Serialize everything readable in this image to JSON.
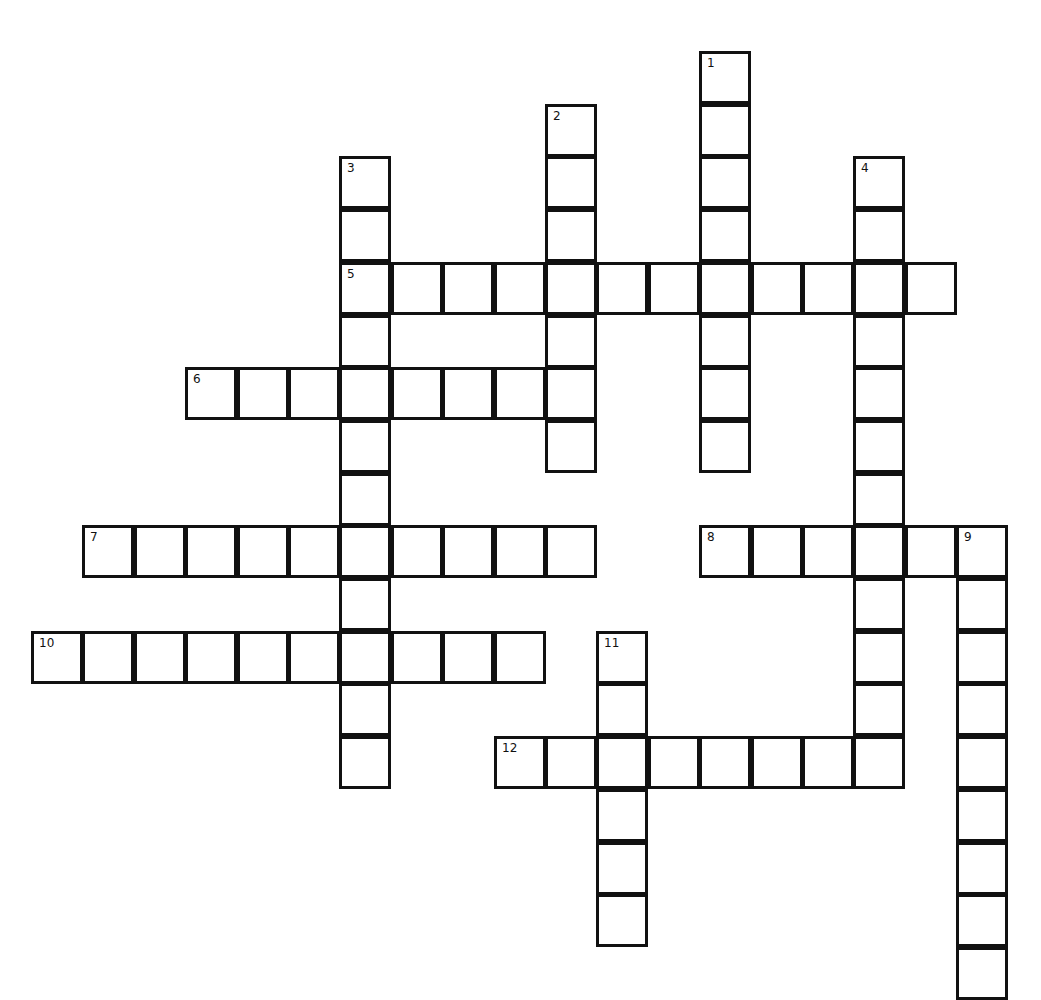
{
  "puzzle": {
    "type": "crossword",
    "grid": {
      "origin_x": 31,
      "origin_y": 51,
      "cell_pitch_x": 51.4,
      "cell_pitch_y": 52.7,
      "cols": 20,
      "rows": 18
    },
    "colors": {
      "border": "#111111",
      "cell_fill": "#ffffff",
      "background": "#ffffff"
    },
    "words": [
      {
        "number": "1",
        "direction": "down",
        "row": 0,
        "col": 13,
        "length": 8
      },
      {
        "number": "2",
        "direction": "down",
        "row": 1,
        "col": 10,
        "length": 7
      },
      {
        "number": "3",
        "direction": "down",
        "row": 2,
        "col": 6,
        "length": 12
      },
      {
        "number": "4",
        "direction": "down",
        "row": 2,
        "col": 16,
        "length": 12
      },
      {
        "number": "5",
        "direction": "across",
        "row": 4,
        "col": 6,
        "length": 12
      },
      {
        "number": "6",
        "direction": "across",
        "row": 6,
        "col": 3,
        "length": 8
      },
      {
        "number": "7",
        "direction": "across",
        "row": 9,
        "col": 1,
        "length": 10
      },
      {
        "number": "8",
        "direction": "across",
        "row": 9,
        "col": 13,
        "length": 6
      },
      {
        "number": "9",
        "direction": "down",
        "row": 9,
        "col": 18,
        "length": 9
      },
      {
        "number": "10",
        "direction": "across",
        "row": 11,
        "col": 0,
        "length": 10
      },
      {
        "number": "11",
        "direction": "down",
        "row": 11,
        "col": 11,
        "length": 6
      },
      {
        "number": "12",
        "direction": "across",
        "row": 13,
        "col": 9,
        "length": 8
      }
    ]
  }
}
